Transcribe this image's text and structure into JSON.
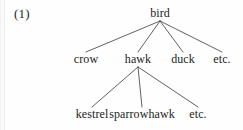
{
  "figure": {
    "example_number": "(1)",
    "caption": "",
    "text_color": "#1c1c1c",
    "background_color": "#fefefe",
    "line_color": "#3a3a3a"
  },
  "tree": {
    "root": {
      "label": "bird",
      "x": 160,
      "children": [
        {
          "label": "crow",
          "x": 86
        },
        {
          "label": "hawk",
          "x": 138
        },
        {
          "label": "duck",
          "x": 183
        },
        {
          "label": "etc.",
          "x": 222
        }
      ]
    },
    "hawk_children": [
      {
        "label": "kestrel",
        "x": 92
      },
      {
        "label": "sparrowhawk",
        "x": 142
      },
      {
        "label": "etc.",
        "x": 198
      }
    ]
  },
  "edges": {
    "root_apex": {
      "x": 160,
      "y": 21
    },
    "hawk_apex": {
      "x": 138,
      "y": 67
    },
    "level2_top_y": 52,
    "level3_top_y": 107
  }
}
